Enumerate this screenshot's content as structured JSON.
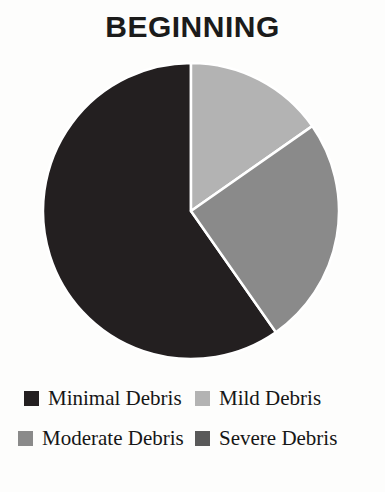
{
  "chart_data": {
    "type": "pie",
    "title": "BEGINNING",
    "subtitle": "",
    "xlabel": "",
    "ylabel": "",
    "grid": false,
    "legend_position": "bottom",
    "legend_columns": 2,
    "categories": [
      "Minimal Debris",
      "Mild Debris",
      "Moderate Debris",
      "Severe Debris"
    ],
    "values": [
      60,
      15,
      25,
      0
    ],
    "units": "percent",
    "start_angle_deg": 0,
    "direction": "clockwise",
    "slice_colors": [
      "#231f20",
      "#b3b3b3",
      "#8a8a8a",
      "#595959"
    ],
    "slice_border_color": "#ffffff",
    "slices": [
      {
        "label": "Minimal Debris",
        "value": 60,
        "color": "#231f20",
        "start_deg": 145,
        "end_deg": 360,
        "visible": true
      },
      {
        "label": "Mild Debris",
        "value": 15,
        "color": "#b3b3b3",
        "start_deg": 0,
        "end_deg": 55,
        "visible": true
      },
      {
        "label": "Moderate Debris",
        "value": 25,
        "color": "#8a8a8a",
        "start_deg": 55,
        "end_deg": 145,
        "visible": true
      },
      {
        "label": "Severe Debris",
        "value": 0,
        "color": "#595959",
        "start_deg": 360,
        "end_deg": 360,
        "visible": false
      }
    ]
  },
  "legend": {
    "rows": [
      [
        {
          "label": "Minimal Debris",
          "color": "#231f20",
          "swatch_name": "legend-swatch-minimal-debris"
        },
        {
          "label": "Mild Debris",
          "color": "#b3b3b3",
          "swatch_name": "legend-swatch-mild-debris"
        }
      ],
      [
        {
          "label": "Moderate Debris",
          "color": "#8a8a8a",
          "swatch_name": "legend-swatch-moderate-debris"
        },
        {
          "label": "Severe Debris",
          "color": "#595959",
          "swatch_name": "legend-swatch-severe-debris"
        }
      ]
    ]
  },
  "colors": {
    "background": "#fdfdfc",
    "title_text": "#1b1b1b",
    "legend_text": "#161616",
    "slice_separator": "#ffffff"
  }
}
